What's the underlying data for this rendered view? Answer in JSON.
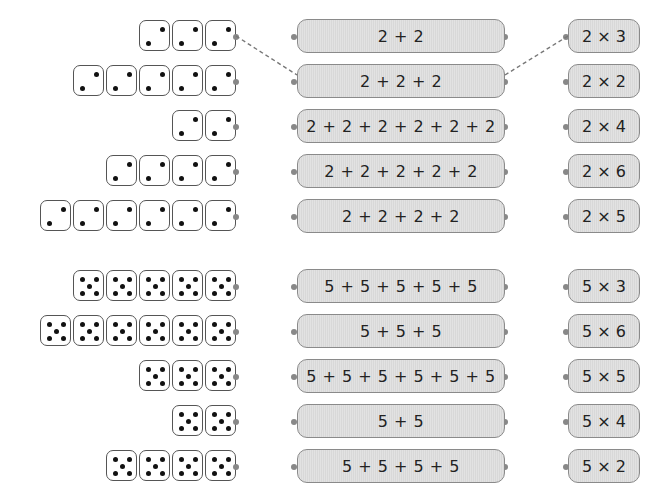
{
  "section_two": {
    "die_face": 2,
    "rows": [
      {
        "dice_count": 3,
        "sum": "2 + 2",
        "product": "2 × 3"
      },
      {
        "dice_count": 5,
        "sum": "2 + 2 + 2",
        "product": "2 × 2"
      },
      {
        "dice_count": 2,
        "sum": "2 + 2 + 2 + 2 + 2 + 2",
        "product": "2 × 4"
      },
      {
        "dice_count": 4,
        "sum": "2 + 2 + 2 + 2 + 2",
        "product": "2 × 6"
      },
      {
        "dice_count": 6,
        "sum": "2 + 2 + 2 + 2",
        "product": "2 × 5"
      }
    ]
  },
  "section_five": {
    "die_face": 5,
    "rows": [
      {
        "dice_count": 5,
        "sum": "5 + 5 + 5 + 5 + 5",
        "product": "5 × 3"
      },
      {
        "dice_count": 6,
        "sum": "5 + 5 + 5",
        "product": "5 × 6"
      },
      {
        "dice_count": 3,
        "sum": "5 + 5 + 5 + 5 + 5 + 5",
        "product": "5 × 5"
      },
      {
        "dice_count": 2,
        "sum": "5 + 5",
        "product": "5 × 4"
      },
      {
        "dice_count": 4,
        "sum": "5 + 5 + 5 + 5",
        "product": "5 × 2"
      }
    ]
  },
  "example_connections": [
    {
      "from": "dice-row-1",
      "to": "sum-row-2"
    },
    {
      "from": "sum-row-2",
      "to": "product-row-1"
    }
  ]
}
